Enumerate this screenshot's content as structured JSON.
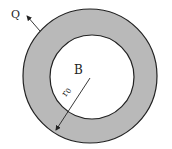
{
  "diagram": {
    "labels": {
      "heat_flux": "Q",
      "inner_region": "B",
      "radius": "r",
      "radius_subscript": "0"
    },
    "colors": {
      "ring_fill": "#b9b9b9",
      "inner_fill": "#ffffff",
      "stroke": "#222222"
    }
  }
}
